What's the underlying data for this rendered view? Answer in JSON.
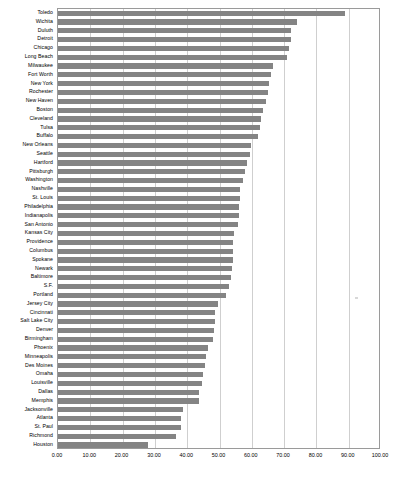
{
  "chart_data": {
    "type": "bar",
    "orientation": "horizontal",
    "title": "",
    "subtitle": "",
    "xlabel": "",
    "ylabel": "",
    "xlim": [
      0,
      100
    ],
    "ylim": null,
    "grid": true,
    "legend": null,
    "legend_position": "none",
    "bar_color": "#848484",
    "axis_color": "#9a9a9a",
    "gridline_color": "#cfcfcf",
    "xticks": [
      "0.00",
      "10.00",
      "20.00",
      "30.00",
      "40.00",
      "50.00",
      "60.00",
      "70.00",
      "80.00",
      "90.00",
      "100.00"
    ],
    "xtick_values": [
      0,
      10,
      20,
      30,
      40,
      50,
      60,
      70,
      80,
      90,
      100
    ],
    "categories": [
      "Toledo",
      "Wichita",
      "Duluth",
      "Detroit",
      "Chicago",
      "Long Beach",
      "Milwaukee",
      "Fort Worth",
      "New York",
      "Rochester",
      "New Haven",
      "Boston",
      "Cleveland",
      "Tulsa",
      "Buffalo",
      "New Orleans",
      "Seattle",
      "Hartford",
      "Pittsburgh",
      "Washington",
      "Nashville",
      "St. Louis",
      "Philadelphia",
      "Indianapolis",
      "San Antonio",
      "Kansas City",
      "Providence",
      "Columbus",
      "Spokane",
      "Newark",
      "Baltimore",
      "S.F.",
      "Portland",
      "Jersey City",
      "Cincinnati",
      "Salt Lake City",
      "Denver",
      "Birmingham",
      "Phoenix",
      "Minneapolis",
      "Des Moines",
      "Omaha",
      "Louisville",
      "Dallas",
      "Memphis",
      "Jacksonville",
      "Atlanta",
      "St. Paul",
      "Richmond",
      "Houston"
    ],
    "values": [
      89.0,
      74.0,
      72.2,
      72.0,
      71.5,
      71.0,
      66.5,
      66.0,
      65.3,
      65.0,
      64.5,
      63.6,
      63.0,
      62.5,
      62.0,
      59.6,
      59.4,
      58.6,
      58.0,
      57.2,
      56.3,
      56.2,
      56.1,
      56.0,
      55.6,
      54.6,
      54.3,
      54.2,
      54.1,
      54.0,
      53.5,
      53.0,
      52.0,
      49.5,
      48.7,
      48.5,
      48.2,
      48.0,
      46.5,
      45.7,
      45.5,
      45.0,
      44.5,
      43.6,
      43.5,
      38.6,
      38.2,
      38.0,
      36.5,
      28.0
    ]
  }
}
